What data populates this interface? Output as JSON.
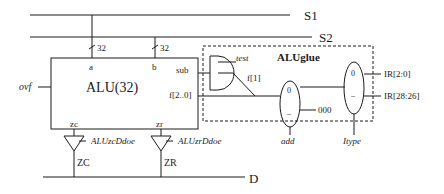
{
  "buses": {
    "s1": "S1",
    "s2": "S2",
    "d": "D"
  },
  "alu": {
    "title": "ALU(32)",
    "port_a": "a",
    "port_b": "b",
    "port_sub": "sub",
    "port_f": "f[2..0]",
    "port_zc": "zc",
    "port_zr": "zr",
    "width_a": "32",
    "width_b": "32",
    "ovf": "ovf"
  },
  "buffers": [
    {
      "enable": "ALUzcDdoe",
      "output": "ZC"
    },
    {
      "enable": "ALUzrDdoe",
      "output": "ZR"
    }
  ],
  "glue": {
    "title": "ALUglue",
    "test": "test",
    "f1": "f[1]",
    "const": "000",
    "mux1_sel": "add",
    "mux2_sel": "Itype",
    "mux_in0": "0",
    "mux_in1": "–",
    "ir_low": "IR[2:0]",
    "ir_high": "IR[28:26]"
  },
  "colors": {
    "ink": "#1a1a1a",
    "background": "#ffffff"
  }
}
